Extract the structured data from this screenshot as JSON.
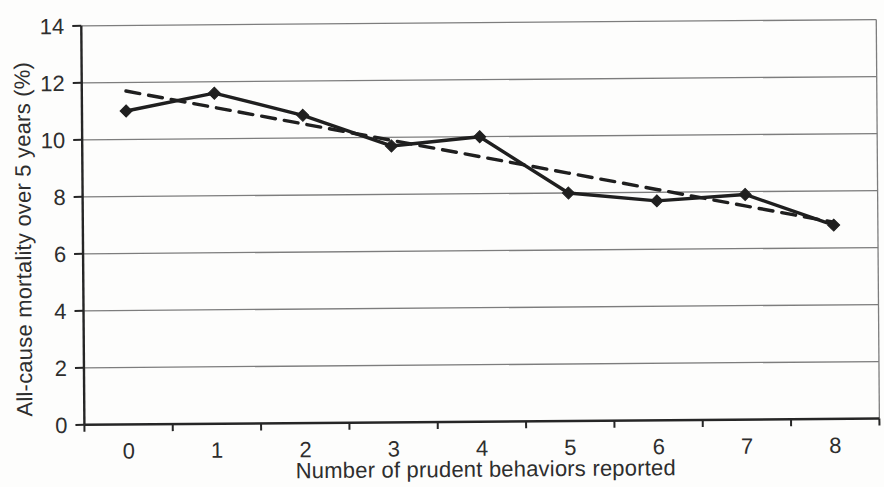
{
  "chart_data": {
    "type": "line",
    "title": "",
    "xlabel": "Number of prudent behaviors reported",
    "ylabel": "All-cause mortality over 5 years (%)",
    "categories": [
      "0",
      "1",
      "2",
      "3",
      "4",
      "5",
      "6",
      "7",
      "8"
    ],
    "series": [
      {
        "name": "All-cause mortality observed",
        "line": "solid",
        "marker": "diamond",
        "values": [
          11.0,
          11.6,
          10.8,
          9.7,
          10.0,
          8.0,
          7.7,
          7.9,
          6.8
        ]
      },
      {
        "name": "Linear trend",
        "line": "dashed",
        "marker": "none",
        "values": [
          11.7,
          11.1,
          10.5,
          9.9,
          9.3,
          8.7,
          8.1,
          7.5,
          6.9
        ]
      }
    ],
    "ylim": [
      0,
      14
    ],
    "yticks": [
      0,
      2,
      4,
      6,
      8,
      10,
      12,
      14
    ],
    "grid": "horizontal",
    "legend": "none",
    "colors": {
      "series": "#1f1f1f",
      "grid": "#7d7d7d",
      "axis": "#262626",
      "text": "#2e2e2e",
      "background": "#fdfdfc"
    }
  }
}
